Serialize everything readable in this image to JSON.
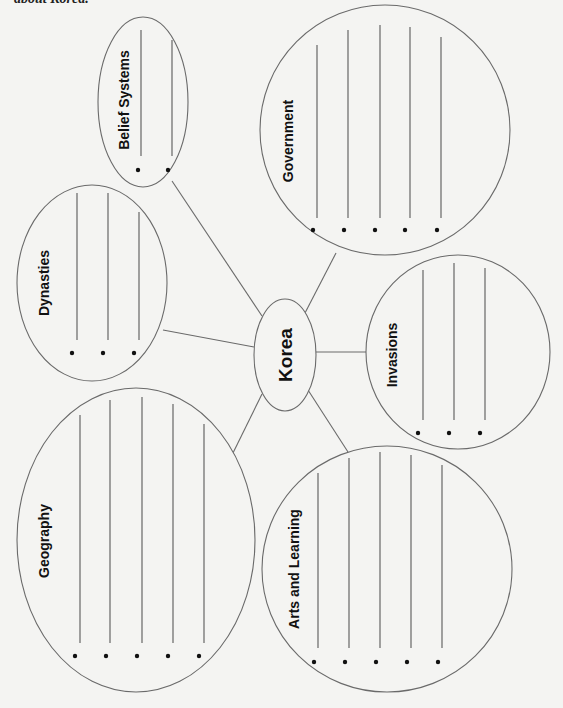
{
  "header": {
    "text": "about Korea."
  },
  "center": {
    "label": "Korea",
    "cx": 285,
    "cy": 355,
    "rx": 31,
    "ry": 56,
    "font_size": 19
  },
  "bubbles": [
    {
      "id": "belief-systems",
      "label": "Belief Systems",
      "cx": 143,
      "cy": 102,
      "rx": 45,
      "ry": 85,
      "label_x": 124,
      "label_y": 100,
      "font_size": 14,
      "lines": [
        {
          "x": 141,
          "y1": 30,
          "y2": 156
        },
        {
          "x": 172,
          "y1": 40,
          "y2": 156
        }
      ],
      "dots": [
        {
          "x": 138,
          "y": 170
        },
        {
          "x": 168,
          "y": 170
        }
      ],
      "connector": {
        "x1": 172,
        "y1": 181,
        "x2": 262,
        "y2": 316
      }
    },
    {
      "id": "government",
      "label": "Government",
      "cx": 385,
      "cy": 130,
      "rx": 125,
      "ry": 125,
      "label_x": 288,
      "label_y": 141,
      "font_size": 14,
      "lines": [
        {
          "x": 317,
          "y1": 45,
          "y2": 218
        },
        {
          "x": 348,
          "y1": 30,
          "y2": 218
        },
        {
          "x": 380,
          "y1": 25,
          "y2": 218
        },
        {
          "x": 410,
          "y1": 27,
          "y2": 218
        },
        {
          "x": 441,
          "y1": 37,
          "y2": 218
        }
      ],
      "dots": [
        {
          "x": 313,
          "y": 230
        },
        {
          "x": 344,
          "y": 230
        },
        {
          "x": 375,
          "y": 230
        },
        {
          "x": 405,
          "y": 230
        },
        {
          "x": 437,
          "y": 230
        }
      ],
      "connector": {
        "x1": 336,
        "y1": 253,
        "x2": 305,
        "y2": 313
      }
    },
    {
      "id": "dynasties",
      "label": "Dynasties",
      "cx": 92,
      "cy": 283,
      "rx": 75,
      "ry": 98,
      "label_x": 44,
      "label_y": 283,
      "font_size": 14,
      "lines": [
        {
          "x": 77,
          "y1": 193,
          "y2": 340
        },
        {
          "x": 108,
          "y1": 193,
          "y2": 340
        },
        {
          "x": 139,
          "y1": 212,
          "y2": 340
        }
      ],
      "dots": [
        {
          "x": 72,
          "y": 353
        },
        {
          "x": 103,
          "y": 353
        },
        {
          "x": 134,
          "y": 353
        }
      ],
      "connector": {
        "x1": 163,
        "y1": 330,
        "x2": 254,
        "y2": 347
      }
    },
    {
      "id": "invasions",
      "label": "Invasions",
      "cx": 458,
      "cy": 352,
      "rx": 92,
      "ry": 97,
      "label_x": 392,
      "label_y": 355,
      "font_size": 14,
      "lines": [
        {
          "x": 423,
          "y1": 270,
          "y2": 420
        },
        {
          "x": 454,
          "y1": 263,
          "y2": 420
        },
        {
          "x": 485,
          "y1": 268,
          "y2": 420
        }
      ],
      "dots": [
        {
          "x": 418,
          "y": 433
        },
        {
          "x": 449,
          "y": 433
        },
        {
          "x": 480,
          "y": 433
        }
      ],
      "connector": {
        "x1": 316,
        "y1": 352,
        "x2": 367,
        "y2": 352
      }
    },
    {
      "id": "geography",
      "label": "Geography",
      "cx": 136,
      "cy": 540,
      "rx": 119,
      "ry": 152,
      "label_x": 44,
      "label_y": 541,
      "font_size": 14,
      "lines": [
        {
          "x": 80,
          "y1": 415,
          "y2": 643
        },
        {
          "x": 110,
          "y1": 400,
          "y2": 643
        },
        {
          "x": 142,
          "y1": 397,
          "y2": 643
        },
        {
          "x": 173,
          "y1": 404,
          "y2": 643
        },
        {
          "x": 204,
          "y1": 424,
          "y2": 643
        }
      ],
      "dots": [
        {
          "x": 75,
          "y": 656
        },
        {
          "x": 106,
          "y": 656
        },
        {
          "x": 137,
          "y": 656
        },
        {
          "x": 168,
          "y": 656
        },
        {
          "x": 199,
          "y": 656
        }
      ],
      "connector": {
        "x1": 232,
        "y1": 455,
        "x2": 262,
        "y2": 394
      }
    },
    {
      "id": "arts-and-learning",
      "label": "Arts and Learning",
      "cx": 387,
      "cy": 569,
      "rx": 125,
      "ry": 123,
      "label_x": 294,
      "label_y": 569,
      "font_size": 14,
      "lines": [
        {
          "x": 318,
          "y1": 473,
          "y2": 648
        },
        {
          "x": 349,
          "y1": 458,
          "y2": 648
        },
        {
          "x": 380,
          "y1": 452,
          "y2": 648
        },
        {
          "x": 411,
          "y1": 455,
          "y2": 648
        },
        {
          "x": 442,
          "y1": 465,
          "y2": 648
        }
      ],
      "dots": [
        {
          "x": 314,
          "y": 662
        },
        {
          "x": 345,
          "y": 662
        },
        {
          "x": 376,
          "y": 662
        },
        {
          "x": 407,
          "y": 662
        },
        {
          "x": 438,
          "y": 662
        }
      ],
      "connector": {
        "x1": 308,
        "y1": 390,
        "x2": 348,
        "y2": 452
      }
    }
  ]
}
